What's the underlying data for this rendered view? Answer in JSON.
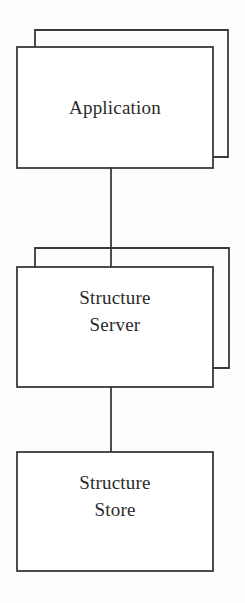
{
  "diagram": {
    "type": "block-diagram",
    "width": 245,
    "height": 603,
    "background_color": "#fdfdfc",
    "stroke_color": "#3a3a3a",
    "text_color": "#2b2b2b",
    "nodes": [
      {
        "id": "application",
        "label": "Application",
        "label_lines": "Application",
        "shape": "stacked-rectangle",
        "stacked": true,
        "front": {
          "x": 17,
          "y": 47,
          "w": 196,
          "h": 121
        },
        "back": {
          "x": 35,
          "y": 30,
          "w": 193,
          "h": 127
        }
      },
      {
        "id": "structure-server",
        "label": "Structure Server",
        "label_lines": "Structure\nServer",
        "shape": "stacked-rectangle",
        "stacked": true,
        "front": {
          "x": 17,
          "y": 267,
          "w": 196,
          "h": 120
        },
        "back": {
          "x": 35,
          "y": 248,
          "w": 194,
          "h": 120
        }
      },
      {
        "id": "structure-store",
        "label": "Structure Store",
        "label_lines": "Structure\nStore",
        "shape": "rectangle",
        "stacked": false,
        "front": {
          "x": 17,
          "y": 452,
          "w": 196,
          "h": 119
        }
      }
    ],
    "connectors": [
      {
        "id": "application-to-structure-server",
        "from": "application",
        "to": "structure-server",
        "orientation": "vertical",
        "x": 111,
        "y1": 168,
        "y2": 267
      },
      {
        "id": "structure-server-to-structure-store",
        "from": "structure-server",
        "to": "structure-store",
        "orientation": "vertical",
        "x": 111,
        "y1": 387,
        "y2": 452
      }
    ]
  }
}
